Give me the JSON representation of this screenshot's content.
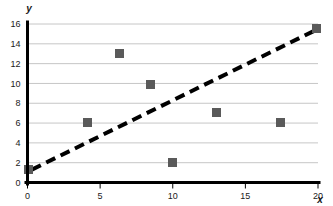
{
  "chart_data": {
    "type": "scatter",
    "title": "",
    "xlabel": "x",
    "ylabel": "y",
    "xlim": [
      0,
      20
    ],
    "ylim": [
      0,
      16
    ],
    "xticks": [
      0,
      5,
      10,
      15,
      20
    ],
    "yticks": [
      0,
      2,
      4,
      6,
      8,
      10,
      12,
      14,
      16
    ],
    "xtick_labels": [
      "0",
      "5",
      "10",
      "15",
      "20"
    ],
    "ytick_labels": [
      "0",
      "2",
      "4",
      "6",
      "8",
      "10",
      "12",
      "14",
      "16"
    ],
    "grid": "horizontal",
    "legend": "none",
    "series": [
      {
        "name": "data points",
        "type": "scatter",
        "marker": "square",
        "color": "#5a5a5a",
        "points": [
          {
            "x": 0.1,
            "y": 1.3
          },
          {
            "x": 4.1,
            "y": 6.05
          },
          {
            "x": 6.3,
            "y": 13.0
          },
          {
            "x": 8.5,
            "y": 9.85
          },
          {
            "x": 10.0,
            "y": 2.0
          },
          {
            "x": 13.0,
            "y": 7.05
          },
          {
            "x": 17.4,
            "y": 6.1
          },
          {
            "x": 19.9,
            "y": 15.5
          }
        ]
      },
      {
        "name": "trend line",
        "type": "line",
        "style": "dashed",
        "color": "#000000",
        "points": [
          {
            "x": 0.3,
            "y": 1.3
          },
          {
            "x": 20.0,
            "y": 15.5
          }
        ]
      }
    ]
  },
  "colors": {
    "marker": "#5a5a5a",
    "gridline": "#b8b8b8",
    "axis": "#000000",
    "text": "#1a1a1a",
    "background": "#ffffff"
  }
}
